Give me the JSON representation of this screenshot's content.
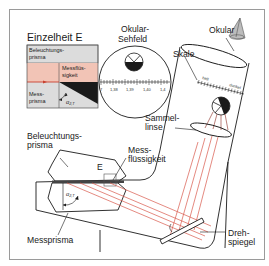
{
  "diagram": {
    "type": "refractometer-cross-section",
    "colors": {
      "ray": "#d8574a",
      "fluid": "#f2c4b6",
      "prism_gray": "#d9d9d9",
      "dark": "#1a1a1a",
      "frame": "#9a9a9a"
    }
  },
  "detail_inset": {
    "title": "Einzelheit E",
    "top_label": "Beleuchtungs-\nprisma",
    "top_label_line1": "Beleuchtungs-",
    "top_label_line2": "prisma",
    "fluid_label_line1": "Messflüs-",
    "fluid_label_line2": "sigkeit",
    "bottom_label_line1": "Mess-",
    "bottom_label_line2": "prisma",
    "angle_label": "α",
    "angle_subscript": "2,T"
  },
  "eyepiece_view": {
    "title_line1": "Okular-",
    "title_line2": "Sehfeld",
    "scale_ticks": [
      "7",
      "1,38",
      "1,39",
      "1,40",
      "1,4"
    ]
  },
  "labels": {
    "okular": "Okular",
    "skale": "Skale",
    "hell": "hell",
    "dunkel": "dunkel",
    "sammellinse_line1": "Sammel-",
    "sammellinse_line2": "linse",
    "beleuchtungsprisma_line1": "Beleuchtungs-",
    "beleuchtungsprisma_line2": "prisma",
    "detail_marker": "E",
    "messfluessigkeit_line1": "Mess-",
    "messfluessigkeit_line2": "flüssigkeit",
    "angle_label": "α",
    "angle_subscript": "2,T",
    "messprisma": "Messprisma",
    "drehspiegel_line1": "Dreh-",
    "drehspiegel_line2": "spiegel"
  }
}
